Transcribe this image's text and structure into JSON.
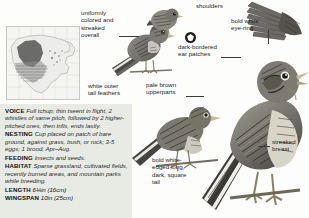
{
  "page": {
    "background": "#fdfdfc",
    "panel_background": "#e8ebe4"
  },
  "map": {
    "name": "range-map",
    "alt": "North America range map, grayscale"
  },
  "info": {
    "entries": [
      {
        "label": "VOICE",
        "text": "Full tchup; thin tseent in flight, 2 whistles of same pitch, followed by 2 higher-pitched ones, then trills, ends lastly."
      },
      {
        "label": "NESTING",
        "text": "Cup placed on patch of bare ground, against grass, bush, or rock; 3-5 eggs; 1 brood; Apr–Aug."
      },
      {
        "label": "FEEDING",
        "text": "Insects and seeds."
      },
      {
        "label": "HABITAT",
        "text": "Sparse grassland, cultivated fields, recently burned areas, and mountain parks while breeding."
      }
    ],
    "measurements": [
      {
        "label": "LENGTH",
        "value": "6¼in (16cm)"
      },
      {
        "label": "WINGSPAN",
        "value": "10in (25cm)"
      }
    ]
  },
  "annotations": [
    {
      "id": "uniformly-colored",
      "text": "uniformly\ncolored and\nstreaked\noverall"
    },
    {
      "id": "white-outer-tail",
      "text": "white outer\ntail feathers"
    },
    {
      "id": "shoulders",
      "text": "shoulders"
    },
    {
      "id": "pale-brown-upperparts",
      "text": "pale brown\nupperparts"
    },
    {
      "id": "dark-bordered-ear-patches",
      "text": "dark-bordered\near patches"
    },
    {
      "id": "bold-white-eye-ring",
      "text": "bold white\neye-ring"
    },
    {
      "id": "bold-white-edged-tail",
      "text": "bold white-\nedged long,\ndark, square\ntail"
    },
    {
      "id": "streaked-breast",
      "text": "streaked\nbreast"
    }
  ]
}
